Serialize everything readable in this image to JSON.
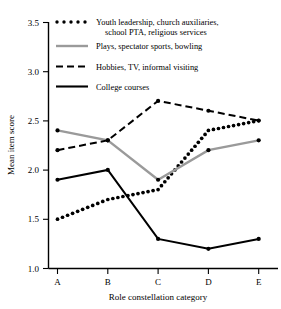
{
  "chart_data": {
    "type": "line",
    "title": "",
    "xlabel": "Role constellation category",
    "ylabel": "Mean item score",
    "categories": [
      "A",
      "B",
      "C",
      "D",
      "E"
    ],
    "ylim": [
      1.0,
      3.5
    ],
    "y_ticks": [
      "1.0",
      "1.5",
      "2.0",
      "2.5",
      "3.0",
      "3.5"
    ],
    "grid": false,
    "legend_position": "top",
    "series": [
      {
        "name": "Youth leadership, church auxiliaries, school PTA, religious services",
        "style": "dotted",
        "color": "#000000",
        "values": [
          1.5,
          1.7,
          1.8,
          2.4,
          2.5
        ]
      },
      {
        "name": "Plays, spectator sports, bowling",
        "style": "solid-gray",
        "color": "#9a9a9a",
        "values": [
          2.4,
          2.3,
          1.9,
          2.2,
          2.3
        ]
      },
      {
        "name": "Hobbies, TV, informal visiting",
        "style": "dashed",
        "color": "#000000",
        "values": [
          2.2,
          2.3,
          2.7,
          2.6,
          2.5
        ]
      },
      {
        "name": "College courses",
        "style": "solid",
        "color": "#000000",
        "values": [
          1.9,
          2.0,
          1.3,
          1.2,
          1.3
        ]
      }
    ]
  },
  "legend": {
    "entries": [
      {
        "swatch": "dotted-swatch",
        "line1": "Youth leadership, church auxiliaries,",
        "line2": "school PTA, religious services"
      },
      {
        "swatch": "gray-line-swatch",
        "line1": "Plays, spectator sports, bowling",
        "line2": ""
      },
      {
        "swatch": "dashed-swatch",
        "line1": "Hobbies, TV, informal visiting",
        "line2": ""
      },
      {
        "swatch": "solid-line-swatch",
        "line1": "College courses",
        "line2": ""
      }
    ]
  },
  "axes": {
    "y_title": "Mean item score",
    "x_title": "Role constellation category",
    "y_tick_labels": [
      "3.5",
      "3.0",
      "2.5",
      "2.0",
      "1.5",
      "1.0"
    ],
    "x_tick_labels": [
      "A",
      "B",
      "C",
      "D",
      "E"
    ]
  }
}
